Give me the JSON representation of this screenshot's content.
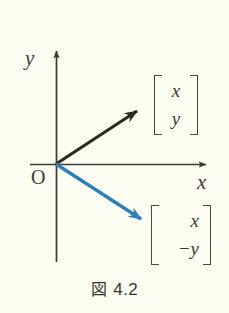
{
  "figure": {
    "caption_prefix": "図",
    "caption_number": "4.2",
    "background_color": "#fdfdf1",
    "axis_color": "#3b3b34",
    "vector_black_color": "#2b2b24",
    "vector_blue_color": "#2e7eb8"
  },
  "axes": {
    "y_label": "y",
    "x_label": "x",
    "origin_label": "O",
    "origin_px": [
      56,
      164
    ],
    "x_axis_start_px": [
      30,
      164
    ],
    "x_axis_end_px": [
      212,
      164
    ],
    "y_axis_top_px": [
      56,
      45
    ],
    "y_axis_bottom_px": [
      56,
      262
    ]
  },
  "vectors": [
    {
      "name": "vector-xy",
      "color": "#2b2b24",
      "from_px": [
        56,
        164
      ],
      "to_px": [
        143,
        107
      ],
      "annotation": {
        "row1": "x",
        "row2": "y"
      }
    },
    {
      "name": "vector-x-negy",
      "color": "#2e7eb8",
      "from_px": [
        56,
        164
      ],
      "to_px": [
        149,
        224
      ],
      "annotation": {
        "row1": "x",
        "row2": "−y"
      }
    }
  ]
}
